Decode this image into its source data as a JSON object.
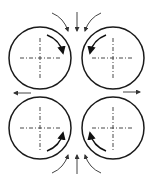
{
  "diagram": {
    "type": "four-roll mill flow schematic",
    "colors": {
      "line": "#1a1a1a",
      "axis": "#333333",
      "arrow": "#444444",
      "background": "#ffffff"
    },
    "rolls": [
      {
        "id": "top-left",
        "cx": 40,
        "cy": 58,
        "r": 31,
        "rotation": "clockwise"
      },
      {
        "id": "top-right",
        "cx": 113,
        "cy": 58,
        "r": 31,
        "rotation": "counterclockwise"
      },
      {
        "id": "bottom-left",
        "cx": 40,
        "cy": 128,
        "r": 31,
        "rotation": "counterclockwise"
      },
      {
        "id": "bottom-right",
        "cx": 113,
        "cy": 128,
        "r": 31,
        "rotation": "clockwise"
      }
    ],
    "flows": {
      "inflow_top": "3 arrows converging downward",
      "inflow_bottom": "3 arrows converging upward",
      "outflow_left": "arrow pointing left",
      "outflow_right": "arrow pointing right"
    }
  }
}
